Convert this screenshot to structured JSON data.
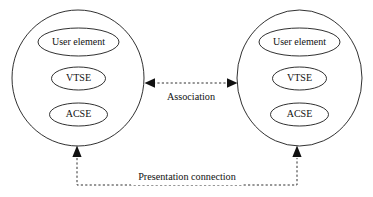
{
  "diagram": {
    "title": "",
    "background_color": "#ffffff",
    "stroke_color": "#1a1a1a",
    "systems": [
      {
        "id": "left-system",
        "name": "left-system",
        "nodes": [
          {
            "id": "left-user-element",
            "label": "User element"
          },
          {
            "id": "left-vtse",
            "label": "VTSE"
          },
          {
            "id": "left-acse",
            "label": "ACSE"
          }
        ]
      },
      {
        "id": "right-system",
        "name": "right-system",
        "nodes": [
          {
            "id": "right-user-element",
            "label": "User element"
          },
          {
            "id": "right-vtse",
            "label": "VTSE"
          },
          {
            "id": "right-acse",
            "label": "ACSE"
          }
        ]
      }
    ],
    "connections": [
      {
        "id": "association",
        "label": "Association",
        "style": "dashed",
        "arrows": "both"
      },
      {
        "id": "presentation-connection",
        "label": "Presentation connection",
        "style": "dashed",
        "arrows": "both"
      }
    ]
  }
}
